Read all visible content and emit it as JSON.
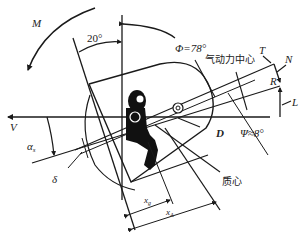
{
  "diagram": {
    "labels": {
      "moment": "M",
      "angle_20": "20°",
      "phi": "Φ=78°",
      "aero_center": "气动力中心",
      "T": "T",
      "N": "N",
      "R": "R",
      "L": "L",
      "D": "D",
      "psi": "Ψ≈8°",
      "V": "V",
      "alpha": "α",
      "alpha_sub": "s",
      "delta": "δ",
      "mass_center": "质心",
      "xg": "x",
      "xg_sub": "g",
      "xa": "x",
      "xa_sub": "A"
    },
    "colors": {
      "line": "#1a1a1a",
      "text": "#222222",
      "background": "#ffffff"
    }
  }
}
